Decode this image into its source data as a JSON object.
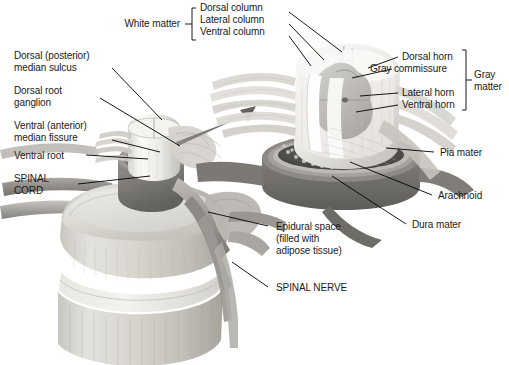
{
  "figure": {
    "background_color": "#ffffff",
    "text_color": "#1a1a1a",
    "line_color": "#000000",
    "arrow_color": "#6b6b6b"
  },
  "group_labels": {
    "white_matter": "White matter",
    "gray_matter_line1": "Gray",
    "gray_matter_line2": "matter"
  },
  "labels": {
    "dorsal_column": "Dorsal column",
    "lateral_column": "Lateral column",
    "ventral_column": "Ventral column",
    "dorsal_horn": "Dorsal horn",
    "gray_commissure": "Gray commissure",
    "lateral_horn": "Lateral horn",
    "ventral_horn": "Ventral horn",
    "dorsal_median_sulcus_line1": "Dorsal (posterior)",
    "dorsal_median_sulcus_line2": "median sulcus",
    "dorsal_root_ganglion_line1": "Dorsal root",
    "dorsal_root_ganglion_line2": "ganglion",
    "ventral_median_fissure_line1": "Ventral (anterior)",
    "ventral_median_fissure_line2": "median fissure",
    "ventral_root": "Ventral root",
    "spinal_cord_line1": "SPINAL",
    "spinal_cord_line2": "CORD",
    "pia_mater": "Pia mater",
    "arachnoid": "Arachnoid",
    "dura_mater": "Dura mater",
    "epidural_space_line1": "Epidural space",
    "epidural_space_line2": "(filled with",
    "epidural_space_line3": "adipose tissue)",
    "spinal_nerve": "SPINAL NERVE"
  },
  "icons": {
    "magnify_arrow": "magnify-arrow-icon",
    "white_matter_bracket": "left-bracket-icon",
    "gray_matter_bracket": "right-bracket-icon"
  }
}
